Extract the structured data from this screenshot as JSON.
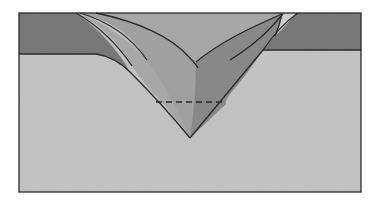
{
  "diagram": {
    "type": "geologic-cross-section",
    "colors": {
      "background": "#ffffff",
      "lower_layer": "#c4c4c4",
      "upper_layer": "#7a7a7a",
      "fold_light": "#a9a9a9",
      "fold_medium": "#8c8c8c",
      "fold_dark": "#6a6a6a",
      "fold_pale": "#c0c0c0",
      "outline": "#2a2a2a"
    },
    "labels": []
  }
}
